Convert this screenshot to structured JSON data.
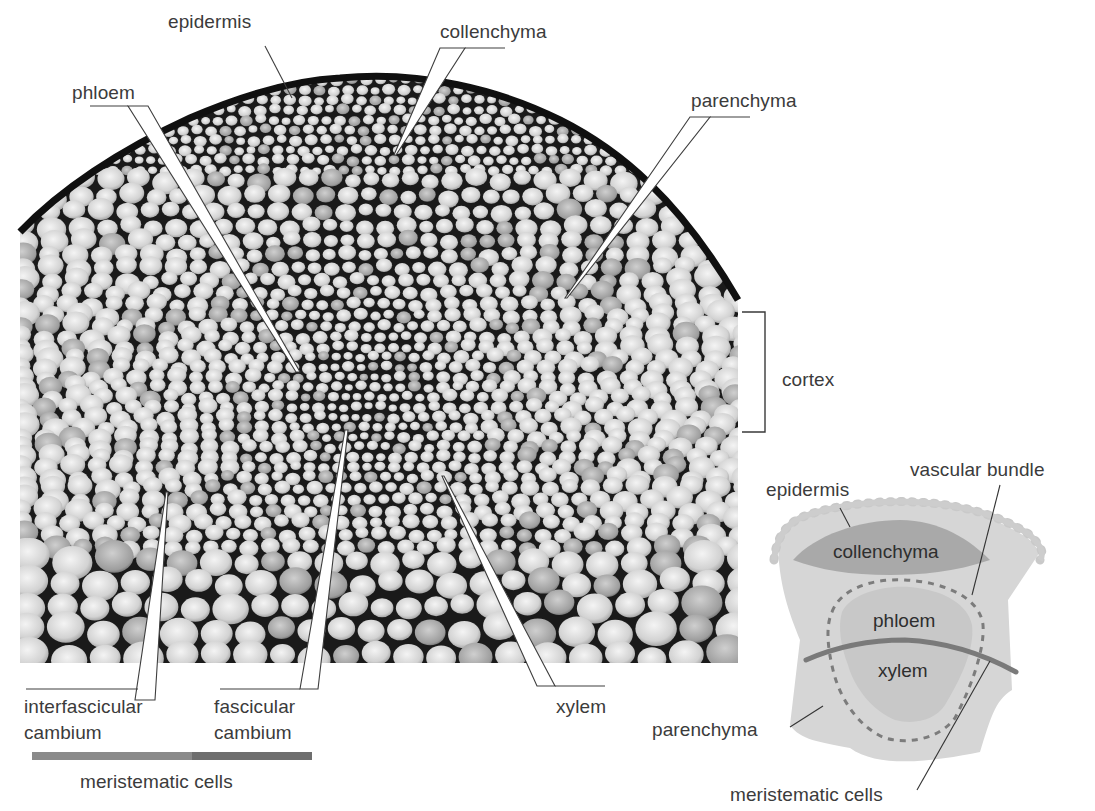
{
  "figure": {
    "colors": {
      "background": "#ffffff",
      "label_text": "#3b3b3b",
      "leader_line": "#444444",
      "cell_wall": "#111111",
      "cell_fill": "#d8d8d8",
      "meristem_bar_light": "#8a8a8a",
      "meristem_bar_dark": "#6e6e6e",
      "schematic_body": "#d6d6d6",
      "schematic_epidermis": "#cfcfcf",
      "schematic_collenchyma": "#a9a9a9",
      "schematic_vascular": "#c6c6c6",
      "schematic_meristem_line": "#7a7a7a",
      "schematic_dash": "#7c7c7c"
    }
  },
  "micrograph": {
    "labels": {
      "epidermis": "epidermis",
      "collenchyma": "collenchyma",
      "phloem": "phloem",
      "parenchyma": "parenchyma",
      "cortex": "cortex",
      "interfascicular_cambium_line1": "interfascicular",
      "interfascicular_cambium_line2": "cambium",
      "fascicular_cambium_line1": "fascicular",
      "fascicular_cambium_line2": "cambium",
      "xylem": "xylem",
      "meristematic_cells": "meristematic cells"
    }
  },
  "schematic": {
    "labels": {
      "epidermis": "epidermis",
      "vascular_bundle": "vascular bundle",
      "collenchyma": "collenchyma",
      "phloem": "phloem",
      "xylem": "xylem",
      "parenchyma": "parenchyma",
      "meristematic_cells": "meristematic cells"
    }
  }
}
